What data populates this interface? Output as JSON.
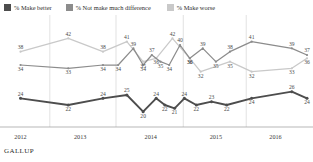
{
  "legend": {
    "items": [
      {
        "label": "% Make better",
        "color": "#4d4d4d",
        "swatch_name": "legend-swatch-make-better"
      },
      {
        "label": "% Not make much difference",
        "color": "#8c8c8c",
        "swatch_name": "legend-swatch-no-difference"
      },
      {
        "label": "% Make worse",
        "color": "#c9c9c9",
        "swatch_name": "legend-swatch-make-worse"
      }
    ]
  },
  "footer": {
    "brand": "GALLUP"
  },
  "chart_data": {
    "type": "line",
    "title": "",
    "subtitle": "",
    "xlabel": "",
    "ylabel": "",
    "grid": "vertical-year-boundaries",
    "legend_position": "top",
    "ylim": [
      16,
      46
    ],
    "xlim": [
      0,
      27
    ],
    "tick_labels": [
      "2012",
      "2013",
      "2014",
      "2015",
      "2016"
    ],
    "tick_positions": [
      0.6,
      6.1,
      12.6,
      18.6,
      24.1
    ],
    "gridline_positions": [
      3.3,
      9.4,
      15.6,
      21.4
    ],
    "series": [
      {
        "name": "% Make better",
        "color": "#4d4d4d",
        "points": [
          {
            "x": 0.6,
            "y": 24,
            "label": "24",
            "lpos": "above"
          },
          {
            "x": 5.0,
            "y": 22,
            "label": "22",
            "lpos": "below"
          },
          {
            "x": 8.2,
            "y": 24,
            "label": "24",
            "lpos": "above"
          },
          {
            "x": 10.4,
            "y": 25,
            "label": "25",
            "lpos": "above"
          },
          {
            "x": 11.9,
            "y": 20,
            "label": "20",
            "lpos": "below"
          },
          {
            "x": 13.1,
            "y": 24,
            "label": "24",
            "lpos": "above"
          },
          {
            "x": 13.9,
            "y": 22,
            "label": "22",
            "lpos": "below"
          },
          {
            "x": 14.8,
            "y": 21,
            "label": "21",
            "lpos": "below"
          },
          {
            "x": 15.7,
            "y": 24,
            "label": "24",
            "lpos": "above"
          },
          {
            "x": 16.8,
            "y": 22,
            "label": "22",
            "lpos": "below"
          },
          {
            "x": 18.2,
            "y": 23,
            "label": "23",
            "lpos": "above"
          },
          {
            "x": 19.6,
            "y": 22,
            "label": "22",
            "lpos": "below"
          },
          {
            "x": 21.9,
            "y": 24,
            "label": "24",
            "lpos": "below"
          },
          {
            "x": 25.6,
            "y": 26,
            "label": "26",
            "lpos": "above"
          },
          {
            "x": 27.0,
            "y": 24,
            "label": "24",
            "lpos": "below"
          }
        ]
      },
      {
        "name": "% Not make much difference",
        "color": "#8c8c8c",
        "points": [
          {
            "x": 0.6,
            "y": 34,
            "label": "34",
            "lpos": "below"
          },
          {
            "x": 5.0,
            "y": 33,
            "label": "33",
            "lpos": "below"
          },
          {
            "x": 8.2,
            "y": 34,
            "label": "34",
            "lpos": "below"
          },
          {
            "x": 9.6,
            "y": 34,
            "label": "34",
            "lpos": "below"
          },
          {
            "x": 11.0,
            "y": 39,
            "label": "39",
            "lpos": "above"
          },
          {
            "x": 11.9,
            "y": 34,
            "label": "34",
            "lpos": "below"
          },
          {
            "x": 12.7,
            "y": 37,
            "label": "37",
            "lpos": "above"
          },
          {
            "x": 13.5,
            "y": 35,
            "label": "35",
            "lpos": "below"
          },
          {
            "x": 14.3,
            "y": 34,
            "label": "34",
            "lpos": "below"
          },
          {
            "x": 15.3,
            "y": 40,
            "label": "40",
            "lpos": "above"
          },
          {
            "x": 16.2,
            "y": 36,
            "label": "36",
            "lpos": "below"
          },
          {
            "x": 17.4,
            "y": 39,
            "label": "39",
            "lpos": "above"
          },
          {
            "x": 18.6,
            "y": 35,
            "label": "35",
            "lpos": "below"
          },
          {
            "x": 19.9,
            "y": 38,
            "label": "38",
            "lpos": "above"
          },
          {
            "x": 21.9,
            "y": 41,
            "label": "41",
            "lpos": "above"
          },
          {
            "x": 25.6,
            "y": 39,
            "label": "39",
            "lpos": "above"
          },
          {
            "x": 27.0,
            "y": 37,
            "label": "37",
            "lpos": "above"
          }
        ]
      },
      {
        "name": "% Make worse",
        "color": "#c9c9c9",
        "points": [
          {
            "x": 0.6,
            "y": 38,
            "label": "38",
            "lpos": "above"
          },
          {
            "x": 5.0,
            "y": 42,
            "label": "42",
            "lpos": "above"
          },
          {
            "x": 8.2,
            "y": 38,
            "label": "38",
            "lpos": "above"
          },
          {
            "x": 10.4,
            "y": 41,
            "label": "41",
            "lpos": "above"
          },
          {
            "x": 11.9,
            "y": 35,
            "label": "35",
            "lpos": "below"
          },
          {
            "x": 13.1,
            "y": 36,
            "label": "36",
            "lpos": "below"
          },
          {
            "x": 14.6,
            "y": 42,
            "label": "42",
            "lpos": "above"
          },
          {
            "x": 16.2,
            "y": 36,
            "label": "36",
            "lpos": "below"
          },
          {
            "x": 17.2,
            "y": 32,
            "label": "32",
            "lpos": "below"
          },
          {
            "x": 19.9,
            "y": 35,
            "label": "35",
            "lpos": "below"
          },
          {
            "x": 21.9,
            "y": 32,
            "label": "32",
            "lpos": "below"
          },
          {
            "x": 25.6,
            "y": 33,
            "label": "33",
            "lpos": "below"
          },
          {
            "x": 27.0,
            "y": 36,
            "label": "36",
            "lpos": "below"
          }
        ]
      }
    ]
  }
}
